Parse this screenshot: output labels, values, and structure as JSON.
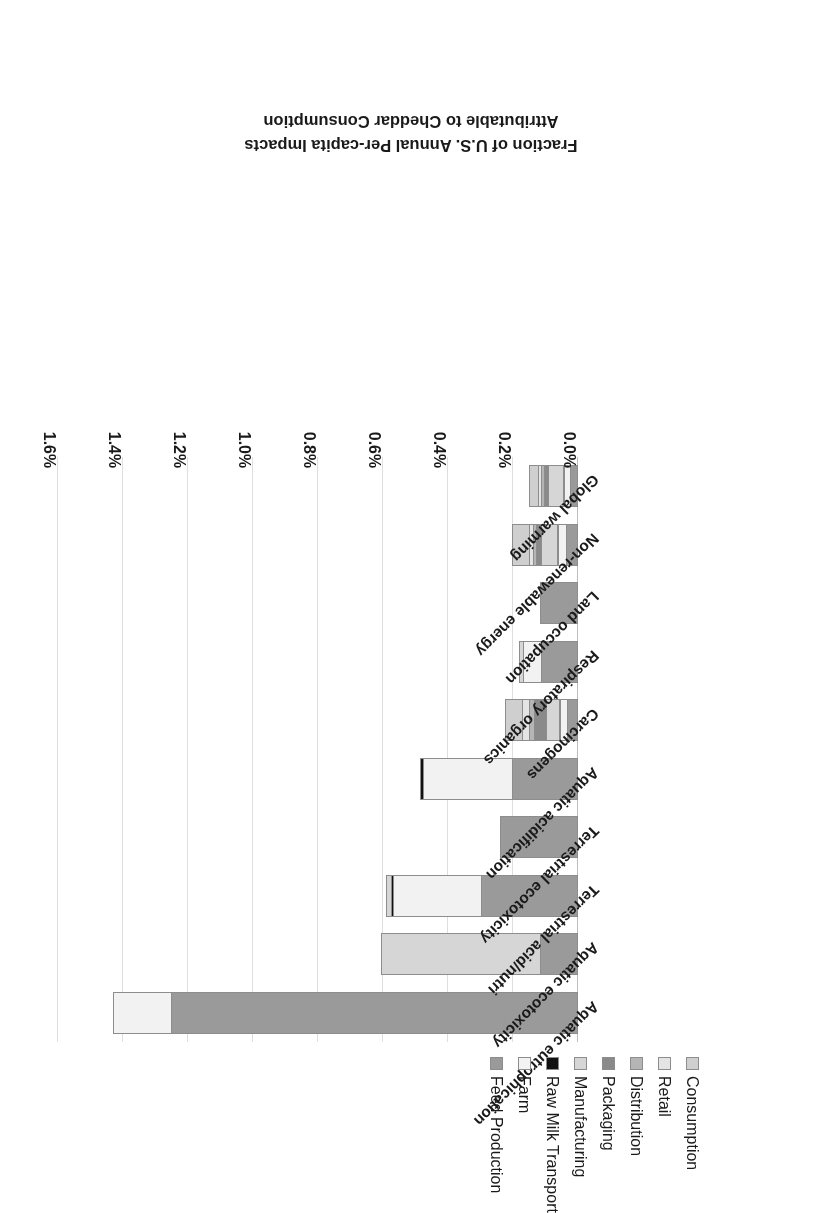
{
  "chart_data": {
    "type": "bar",
    "orientation": "horizontal-stacked",
    "title": "",
    "xlabel": "Fraction of U.S. Annual Per-capita Impacts Attributable to Cheddar Consumption",
    "ylabel": "",
    "xlim": [
      0.0,
      1.6
    ],
    "xunit": "%",
    "xticks": [
      "0.0%",
      "0.2%",
      "0.4%",
      "0.6%",
      "0.8%",
      "1.0%",
      "1.2%",
      "1.4%",
      "1.6%"
    ],
    "xtick_values": [
      0.0,
      0.2,
      0.4,
      0.6,
      0.8,
      1.0,
      1.2,
      1.4,
      1.6
    ],
    "grid": true,
    "legend_position": "left",
    "categories": [
      "Aquatic eutrophication",
      "Aquatic ecotoxicity",
      "Terrestrial acid/nutri",
      "Terrestrial ecotoxicity",
      "Aquatic acidification",
      "Carcinogens",
      "Respiratory organics",
      "Land occupation",
      "Non-renewable energy",
      "Global warming"
    ],
    "series": [
      {
        "name": "Feed Production",
        "color": "#9a9a9a",
        "values": [
          1.25,
          0.115,
          0.295,
          0.24,
          0.2,
          0.03,
          0.11,
          0.118,
          0.035,
          0.022
        ]
      },
      {
        "name": "Farm",
        "color": "#f2f2f2",
        "values": [
          0.18,
          0.0,
          0.27,
          0.0,
          0.275,
          0.022,
          0.055,
          0.0,
          0.022,
          0.018
        ]
      },
      {
        "name": "Raw Milk Transport",
        "color": "#111111",
        "values": [
          0.0,
          0.0,
          0.008,
          0.0,
          0.01,
          0.004,
          0.0,
          0.0,
          0.004,
          0.004
        ]
      },
      {
        "name": "Manufacturing",
        "color": "#d6d6d6",
        "values": [
          0.0,
          0.49,
          0.018,
          0.0,
          0.0,
          0.04,
          0.015,
          0.0,
          0.05,
          0.045
        ]
      },
      {
        "name": "Packaging",
        "color": "#8a8a8a",
        "values": [
          0.0,
          0.0,
          0.0,
          0.0,
          0.0,
          0.035,
          0.0,
          0.0,
          0.014,
          0.012
        ]
      },
      {
        "name": "Distribution",
        "color": "#b5b5b5",
        "values": [
          0.0,
          0.0,
          0.0,
          0.0,
          0.0,
          0.018,
          0.0,
          0.0,
          0.01,
          0.009
        ]
      },
      {
        "name": "Retail",
        "color": "#e4e4e4",
        "values": [
          0.0,
          0.0,
          0.0,
          0.0,
          0.0,
          0.02,
          0.0,
          0.0,
          0.012,
          0.01
        ]
      },
      {
        "name": "Consumption",
        "color": "#cfcfcf",
        "values": [
          0.0,
          0.0,
          0.0,
          0.0,
          0.0,
          0.055,
          0.0,
          0.0,
          0.055,
          0.03
        ]
      }
    ],
    "totals": [
      1.43,
      0.605,
      0.591,
      0.24,
      0.485,
      0.224,
      0.18,
      0.118,
      0.202,
      0.15
    ]
  },
  "legend": {
    "items": [
      {
        "label": "Consumption",
        "color": "#cfcfcf"
      },
      {
        "label": "Retail",
        "color": "#e4e4e4"
      },
      {
        "label": "Distribution",
        "color": "#b5b5b5"
      },
      {
        "label": "Packaging",
        "color": "#8a8a8a"
      },
      {
        "label": "Manufacturing",
        "color": "#d6d6d6"
      },
      {
        "label": "Raw Milk Transport",
        "color": "#111111"
      },
      {
        "label": "Farm",
        "color": "#f2f2f2"
      },
      {
        "label": "Feed Production",
        "color": "#9a9a9a"
      }
    ]
  },
  "axis": {
    "title_line1": "Fraction of U.S. Annual Per-capita Impacts",
    "title_line2": "Attributable to Cheddar Consumption"
  }
}
